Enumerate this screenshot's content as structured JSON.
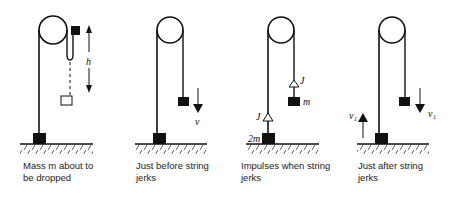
{
  "panels": [
    {
      "id": "panel-1",
      "caption_line1": "Mass m about to",
      "caption_line2": "be dropped",
      "labels": {
        "height": "h"
      }
    },
    {
      "id": "panel-2",
      "caption_line1": "Just before string",
      "caption_line2": "jerks",
      "labels": {
        "velocity": "v"
      }
    },
    {
      "id": "panel-3",
      "caption_line1": "Impulses when string",
      "caption_line2": "jerks",
      "labels": {
        "impulse_top": "J",
        "impulse_bottom": "J",
        "mass_top": "m",
        "mass_bottom": "2m"
      }
    },
    {
      "id": "panel-4",
      "caption_line1": "Just after string",
      "caption_line2": "jerks",
      "labels": {
        "velocity_left": "v₁",
        "velocity_right": "v₁"
      }
    }
  ]
}
